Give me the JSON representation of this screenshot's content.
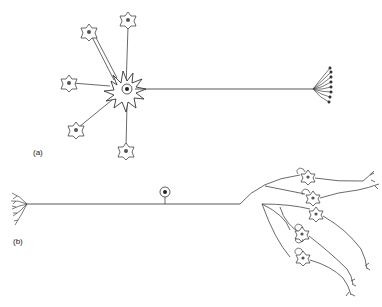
{
  "figure": {
    "panels": [
      {
        "id": "a",
        "label": "(a)",
        "description": "Convergence: many presynaptic neurons synapse onto one neuron whose axon ends in a terminal arbor",
        "presynaptic_neuron_count": 6
      },
      {
        "id": "b",
        "label": "(b)",
        "description": "Divergence: one neuron's axon branches to synapse onto many postsynaptic neurons",
        "postsynaptic_neuron_count": 6
      }
    ],
    "colors": {
      "ink": "#333333",
      "background": "#ffffff"
    }
  }
}
